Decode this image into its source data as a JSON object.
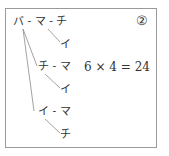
{
  "diagram": {
    "label": "②",
    "tree": {
      "root": "バ",
      "row1": {
        "text": "バ - マ - チ",
        "branch": "イ"
      },
      "row2": {
        "text": "チ - マ",
        "branch": "イ"
      },
      "row3": {
        "text": "イ - マ",
        "branch": "チ"
      }
    },
    "equation": "6 × 4 = 24"
  }
}
